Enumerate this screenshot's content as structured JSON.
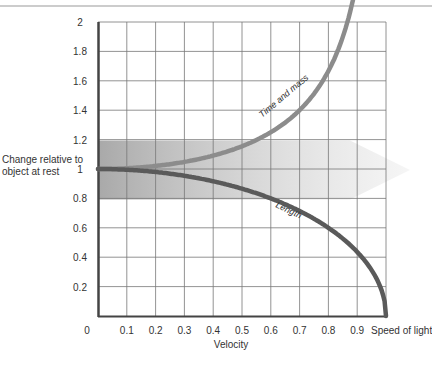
{
  "chart_data": {
    "type": "line",
    "title": "",
    "xlabel": "Velocity",
    "ylabel": "Change relative to object at rest",
    "x_end_label": "Speed of light",
    "x_ticks": [
      "0",
      "0.1",
      "0.2",
      "0.3",
      "0.4",
      "0.5",
      "0.6",
      "0.7",
      "0.8",
      "0.9"
    ],
    "y_ticks": [
      "0.2",
      "0.4",
      "0.6",
      "0.8",
      "1",
      "1.2",
      "1.4",
      "1.6",
      "1.8",
      "2"
    ],
    "xlim": [
      0,
      1
    ],
    "ylim": [
      0,
      2
    ],
    "grid": true,
    "legend": "none (curves labeled inline)",
    "series": [
      {
        "name": "Time and mass",
        "color": "#8a8a8a",
        "x": [
          0,
          0.1,
          0.2,
          0.3,
          0.4,
          0.5,
          0.6,
          0.7,
          0.8,
          0.85,
          0.9
        ],
        "values": [
          1.0,
          1.005,
          1.02,
          1.048,
          1.091,
          1.155,
          1.25,
          1.4,
          1.667,
          1.898,
          2.294
        ]
      },
      {
        "name": "Length",
        "color": "#555555",
        "x": [
          0,
          0.1,
          0.2,
          0.3,
          0.4,
          0.5,
          0.6,
          0.7,
          0.8,
          0.9,
          0.95,
          1.0
        ],
        "values": [
          1.0,
          0.995,
          0.98,
          0.954,
          0.917,
          0.866,
          0.8,
          0.714,
          0.6,
          0.436,
          0.312,
          0.0
        ]
      }
    ],
    "annotations": [
      {
        "type": "shaded_band",
        "y_range": [
          0.8,
          1.2
        ],
        "x_range": [
          0,
          0.9
        ],
        "shape": "arrow pointing right",
        "color": "#b0b0b0"
      }
    ]
  },
  "labels": {
    "ylabel_line1": "Change relative to",
    "ylabel_line2": "object at rest",
    "xlabel": "Velocity",
    "x_end": "Speed of light",
    "series_time_mass": "Time and mass",
    "series_length": "Length"
  },
  "ticks": {
    "x": [
      "0",
      "0.1",
      "0.2",
      "0.3",
      "0.4",
      "0.5",
      "0.6",
      "0.7",
      "0.8",
      "0.9"
    ],
    "y": [
      "2",
      "1.8",
      "1.6",
      "1.4",
      "1.2",
      "1",
      "0.8",
      "0.6",
      "0.4",
      "0.2"
    ]
  }
}
